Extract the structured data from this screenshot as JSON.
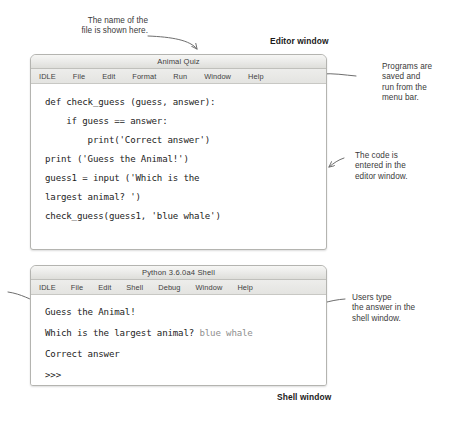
{
  "annotations": {
    "file_name_note": "The name of the\nfile is shown here.",
    "file_name_note_line1": "The name of the",
    "file_name_note_line2": "file is shown here.",
    "editor_window_label": "Editor window",
    "shell_window_label": "Shell window",
    "menu_bar_note": "Programs are\nsaved and\nrun from the\nmenu bar.",
    "menu_bar_note_line1": "Programs are",
    "menu_bar_note_line2": "saved and",
    "menu_bar_note_line3": "run from the",
    "menu_bar_note_line4": "menu bar.",
    "code_note_line1": "The code is",
    "code_note_line2": "entered in the",
    "code_note_line3": "editor window.",
    "shell_note_line1": "Users type",
    "shell_note_line2": "the answer in the",
    "shell_note_line3": "shell window."
  },
  "editor_window": {
    "title": "Animal Quiz",
    "menus": [
      "IDLE",
      "File",
      "Edit",
      "Format",
      "Run",
      "Window",
      "Help"
    ],
    "code_lines": [
      "def check_guess (guess, answer):",
      "    if guess == answer:",
      "        print('Correct answer')",
      "print ('Guess the Animal!')",
      "guess1 = input ('Which is the",
      "largest animal? ')",
      "check_guess(guess1, 'blue whale')"
    ]
  },
  "shell_window": {
    "title": "Python 3.6.0a4 Shell",
    "menus": [
      "IDLE",
      "File",
      "Edit",
      "Shell",
      "Debug",
      "Window",
      "Help"
    ],
    "lines": [
      {
        "program_text": "Guess the Animal!",
        "user_text": ""
      },
      {
        "program_text": "Which is the largest animal? ",
        "user_text": "blue whale"
      },
      {
        "program_text": "Correct answer",
        "user_text": ""
      },
      {
        "program_text": ">>>",
        "user_text": ""
      }
    ]
  },
  "colors": {
    "page_background": "#ffffff",
    "window_border": "#b4b4b0",
    "titlebar_top": "#f6f6f4",
    "titlebar_bottom": "#dededa",
    "menubar": "#e8e8e6",
    "code_text": "#1c1c1c",
    "user_input_text": "#8f8f8f",
    "annotation_text": "#3a3a3a",
    "arrow_stroke": "#6e6e6e"
  }
}
